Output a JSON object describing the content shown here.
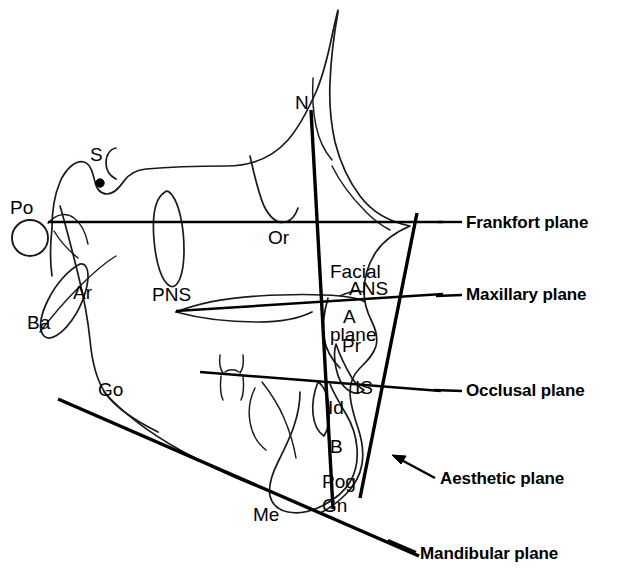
{
  "figure": {
    "kind": "cephalometric-tracing",
    "background_color": "#ffffff",
    "ink_color": "#000000"
  },
  "landmarks": [
    {
      "id": "Po",
      "label": "Po",
      "x": 10,
      "y": 198,
      "desc": "porion"
    },
    {
      "id": "S",
      "label": "S",
      "x": 90,
      "y": 145,
      "desc": "sella"
    },
    {
      "id": "N",
      "label": "N",
      "x": 295,
      "y": 93,
      "desc": "nasion"
    },
    {
      "id": "Or",
      "label": "Or",
      "x": 268,
      "y": 228,
      "desc": "orbitale"
    },
    {
      "id": "Ba",
      "label": "Ba",
      "x": 27,
      "y": 313,
      "desc": "basion"
    },
    {
      "id": "Ar",
      "label": "Ar",
      "x": 73,
      "y": 283,
      "desc": "articulare"
    },
    {
      "id": "PNS",
      "label": "PNS",
      "x": 152,
      "y": 285,
      "desc": "posterior nasal spine"
    },
    {
      "id": "ANS",
      "label": "ANS",
      "x": 349,
      "y": 279,
      "desc": "anterior nasal spine"
    },
    {
      "id": "A",
      "label": "A",
      "x": 343,
      "y": 307,
      "desc": "A point"
    },
    {
      "id": "Pr",
      "label": "Pr",
      "x": 342,
      "y": 336,
      "desc": "prosthion"
    },
    {
      "id": "Go",
      "label": "Go",
      "x": 98,
      "y": 380,
      "desc": "gonion"
    },
    {
      "id": "IS",
      "label": "IS",
      "x": 355,
      "y": 378,
      "desc": "incisor superius"
    },
    {
      "id": "Id",
      "label": "Id",
      "x": 328,
      "y": 398,
      "desc": "infradentale"
    },
    {
      "id": "B",
      "label": "B",
      "x": 330,
      "y": 437,
      "desc": "B point"
    },
    {
      "id": "Pog",
      "label": "Pog",
      "x": 322,
      "y": 472,
      "desc": "pogonion"
    },
    {
      "id": "Gn",
      "label": "Gn",
      "x": 322,
      "y": 496,
      "desc": "gnathion"
    },
    {
      "id": "Me",
      "label": "Me",
      "x": 253,
      "y": 505,
      "desc": "menton"
    }
  ],
  "facial_plane_label": {
    "line1": "Facial",
    "line2": "plane",
    "x": 330,
    "y": 218
  },
  "planes": [
    {
      "id": "frankfort",
      "label": "Frankfort plane",
      "label_x": 466,
      "label_y": 214,
      "leader_from_x": 440,
      "leader_from_y": 222,
      "leader_to_x": 462,
      "leader_to_y": 222
    },
    {
      "id": "maxillary",
      "label": "Maxillary plane",
      "label_x": 466,
      "label_y": 286,
      "leader_from_x": 437,
      "leader_from_y": 296,
      "leader_to_x": 462,
      "leader_to_y": 295
    },
    {
      "id": "occlusal",
      "label": "Occlusal plane",
      "label_x": 466,
      "label_y": 382,
      "leader_from_x": 434,
      "leader_from_y": 391,
      "leader_to_x": 462,
      "leader_to_y": 391
    },
    {
      "id": "aesthetic",
      "label": "Aesthetic plane",
      "label_x": 440,
      "label_y": 470,
      "leader_from_x": 435,
      "leader_from_y": 478,
      "leader_to_x": 392,
      "leader_to_y": 455
    },
    {
      "id": "mandibular",
      "label": "Mandibular plane",
      "label_x": 420,
      "label_y": 545,
      "leader_from_x": 388,
      "leader_from_y": 540,
      "leader_to_x": 416,
      "leader_to_y": 553
    }
  ],
  "plane_geometry": {
    "frankfort": {
      "x1": 48,
      "y1": 222,
      "x2": 443,
      "y2": 222
    },
    "maxillary": {
      "x1": 176,
      "y1": 311,
      "x2": 443,
      "y2": 294
    },
    "occlusal": {
      "x1": 200,
      "y1": 372,
      "x2": 441,
      "y2": 391
    },
    "facial": {
      "x1": 311,
      "y1": 110,
      "x2": 333,
      "y2": 509
    },
    "aesthetic": {
      "x1": 417,
      "y1": 213,
      "x2": 360,
      "y2": 498
    },
    "mandibular": {
      "x1": 58,
      "y1": 399,
      "x2": 419,
      "y2": 556
    }
  }
}
